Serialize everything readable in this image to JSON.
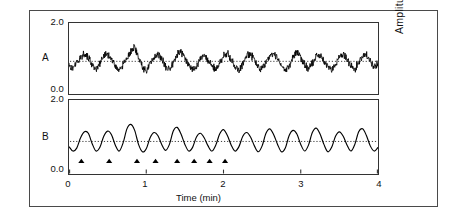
{
  "figure": {
    "panel_a_letter": "A",
    "panel_b_letter": "B",
    "x_axis_title": "Time (min)",
    "y_axis_title": "Amplitude (mV)"
  },
  "axes": {
    "y_a_top": "2.0",
    "y_a_bottom": "0.0",
    "y_b_top": "2.0",
    "y_b_bottom": "0.0",
    "x_ticks": [
      "0",
      "1",
      "2",
      "3",
      "4"
    ]
  },
  "chart_data": {
    "type": "line",
    "title": "",
    "xlabel": "Time (min)",
    "ylabel": "Amplitude (mV)",
    "xlim": [
      0,
      4
    ],
    "ylim": [
      0,
      2
    ],
    "grid": false,
    "legend": "none",
    "panels": [
      {
        "name": "A",
        "description": "raw noisy amplitude recording with high-frequency noise superimposed on slow oscillations",
        "ylim": [
          0,
          2
        ],
        "yticks": [
          "0.0",
          "2.0"
        ],
        "reference_line": {
          "style": "dotted",
          "y": 0.92
        },
        "oscillation_count": 10,
        "mean_period_min": 0.4,
        "noise": {
          "type": "high-frequency",
          "amplitude": 0.13
        },
        "series": [
          {
            "name": "raw signal",
            "x": [
              0.0,
              0.05,
              0.1,
              0.15,
              0.2,
              0.25,
              0.3,
              0.35,
              0.4,
              0.45,
              0.5,
              0.55,
              0.6,
              0.65,
              0.7,
              0.75,
              0.8,
              0.85,
              0.9,
              0.95,
              1.0,
              1.05,
              1.1,
              1.15,
              1.2,
              1.25,
              1.3,
              1.35,
              1.4,
              1.45,
              1.5,
              1.55,
              1.6,
              1.65,
              1.7,
              1.75,
              1.8,
              1.85,
              1.9,
              1.95,
              2.0,
              2.05,
              2.1,
              2.15,
              2.2,
              2.25,
              2.3,
              2.35,
              2.4,
              2.45,
              2.5,
              2.55,
              2.6,
              2.65,
              2.7,
              2.75,
              2.8,
              2.85,
              2.9,
              2.95,
              3.0,
              3.05,
              3.1,
              3.15,
              3.2,
              3.25,
              3.3,
              3.35,
              3.4,
              3.45,
              3.5,
              3.55,
              3.6,
              3.65,
              3.7,
              3.75,
              3.8,
              3.85,
              3.9,
              3.95,
              4.0
            ],
            "values": [
              0.78,
              0.7,
              0.9,
              1.05,
              1.12,
              1.02,
              0.8,
              0.7,
              0.86,
              1.08,
              1.14,
              0.98,
              0.78,
              0.68,
              0.82,
              1.02,
              1.2,
              1.34,
              1.05,
              0.76,
              0.66,
              0.82,
              1.06,
              1.14,
              1.0,
              0.78,
              0.7,
              0.88,
              1.12,
              1.18,
              1.02,
              0.8,
              0.68,
              0.78,
              1.0,
              1.1,
              0.96,
              0.76,
              0.7,
              0.88,
              1.08,
              1.14,
              0.98,
              0.78,
              0.68,
              0.84,
              1.06,
              1.12,
              0.94,
              0.74,
              0.7,
              0.9,
              1.1,
              1.16,
              1.0,
              0.78,
              0.66,
              0.8,
              1.04,
              1.18,
              1.02,
              0.8,
              0.7,
              0.86,
              1.06,
              1.12,
              0.96,
              0.76,
              0.68,
              0.84,
              1.08,
              1.14,
              0.98,
              0.78,
              0.7,
              0.88,
              1.06,
              1.1,
              0.94,
              0.78,
              0.86
            ]
          }
        ]
      },
      {
        "name": "B",
        "description": "smoothed / filtered version of the same recording with event markers",
        "ylim": [
          0,
          2
        ],
        "yticks": [
          "0.0",
          "2.0"
        ],
        "reference_line": {
          "style": "dotted",
          "y": 0.88
        },
        "oscillation_count": 10,
        "mean_period_min": 0.4,
        "markers": {
          "symbol": "filled-triangle",
          "count": 8,
          "y": 0.3,
          "x": [
            0.16,
            0.52,
            0.88,
            1.12,
            1.4,
            1.62,
            1.82,
            2.02
          ]
        },
        "series": [
          {
            "name": "filtered signal",
            "x": [
              0.0,
              0.05,
              0.1,
              0.15,
              0.2,
              0.25,
              0.3,
              0.35,
              0.4,
              0.45,
              0.5,
              0.55,
              0.6,
              0.65,
              0.7,
              0.75,
              0.8,
              0.85,
              0.9,
              0.95,
              1.0,
              1.05,
              1.1,
              1.15,
              1.2,
              1.25,
              1.3,
              1.35,
              1.4,
              1.45,
              1.5,
              1.55,
              1.6,
              1.65,
              1.7,
              1.75,
              1.8,
              1.85,
              1.9,
              1.95,
              2.0,
              2.05,
              2.1,
              2.15,
              2.2,
              2.25,
              2.3,
              2.35,
              2.4,
              2.45,
              2.5,
              2.55,
              2.6,
              2.65,
              2.7,
              2.75,
              2.8,
              2.85,
              2.9,
              2.95,
              3.0,
              3.05,
              3.1,
              3.15,
              3.2,
              3.25,
              3.3,
              3.35,
              3.4,
              3.45,
              3.5,
              3.55,
              3.6,
              3.65,
              3.7,
              3.75,
              3.8,
              3.85,
              3.9,
              3.95,
              4.0
            ],
            "values": [
              0.74,
              0.62,
              0.7,
              0.98,
              1.14,
              1.1,
              0.82,
              0.62,
              0.72,
              1.02,
              1.16,
              1.06,
              0.78,
              0.62,
              0.84,
              1.22,
              1.34,
              1.18,
              0.8,
              0.6,
              0.68,
              0.98,
              1.12,
              1.04,
              0.8,
              0.64,
              0.8,
              1.16,
              1.26,
              1.08,
              0.8,
              0.62,
              0.72,
              1.0,
              1.1,
              0.98,
              0.76,
              0.62,
              0.78,
              1.08,
              1.2,
              1.04,
              0.78,
              0.62,
              0.74,
              1.02,
              1.12,
              1.0,
              0.76,
              0.6,
              0.76,
              1.1,
              1.22,
              1.06,
              0.8,
              0.6,
              0.7,
              1.04,
              1.18,
              1.08,
              0.8,
              0.62,
              0.78,
              1.12,
              1.24,
              1.08,
              0.8,
              0.6,
              0.72,
              1.02,
              1.14,
              1.02,
              0.78,
              0.62,
              0.8,
              1.14,
              1.22,
              1.04,
              0.76,
              0.62,
              0.72
            ]
          }
        ]
      }
    ]
  }
}
